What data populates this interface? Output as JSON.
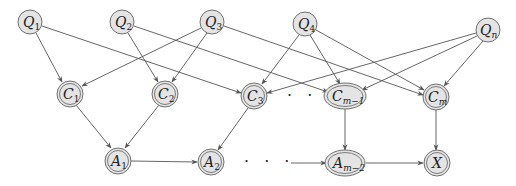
{
  "diagram": {
    "type": "bayesian-network",
    "colors": {
      "node_fill": "#e4e4e4",
      "node_stroke": "#707070",
      "edge": "#555555"
    },
    "query_nodes": [
      {
        "id": "Q1",
        "base": "Q",
        "sub": "1",
        "x": 30,
        "y": 22
      },
      {
        "id": "Q2",
        "base": "Q",
        "sub": "2",
        "x": 122,
        "y": 22
      },
      {
        "id": "Q3",
        "base": "Q",
        "sub": "3",
        "x": 212,
        "y": 22
      },
      {
        "id": "Q4",
        "base": "Q",
        "sub": "4",
        "x": 305,
        "y": 24
      },
      {
        "id": "Qn",
        "base": "Q",
        "sub": "n",
        "x": 488,
        "y": 30
      }
    ],
    "clause_nodes": [
      {
        "id": "C1",
        "base": "C",
        "sub": "1",
        "x": 70,
        "y": 94
      },
      {
        "id": "C2",
        "base": "C",
        "sub": "2",
        "x": 165,
        "y": 94
      },
      {
        "id": "C3",
        "base": "C",
        "sub": "3",
        "x": 254,
        "y": 96
      },
      {
        "id": "Cm-1",
        "base": "C",
        "sub": "m−1",
        "x": 345,
        "y": 96
      },
      {
        "id": "Cm",
        "base": "C",
        "sub": "m",
        "x": 436,
        "y": 97
      }
    ],
    "and_nodes": [
      {
        "id": "A1",
        "base": "A",
        "sub": "1",
        "x": 118,
        "y": 160
      },
      {
        "id": "A2",
        "base": "A",
        "sub": "2",
        "x": 211,
        "y": 162
      },
      {
        "id": "Am-2",
        "base": "A",
        "sub": "m−2",
        "x": 345,
        "y": 163
      },
      {
        "id": "X",
        "base": "X",
        "sub": "",
        "x": 437,
        "y": 163
      }
    ],
    "ellipsis": {
      "clause_row": "· · ·",
      "and_row": "· · ·"
    },
    "edges": [
      [
        "Q1",
        "C1"
      ],
      [
        "Q1",
        "C3"
      ],
      [
        "Q2",
        "C2"
      ],
      [
        "Q2",
        "Cm-1"
      ],
      [
        "Q3",
        "C1"
      ],
      [
        "Q3",
        "C2"
      ],
      [
        "Q3",
        "Cm"
      ],
      [
        "Q4",
        "C3"
      ],
      [
        "Q4",
        "Cm-1"
      ],
      [
        "Q4",
        "Cm"
      ],
      [
        "Qn",
        "C3"
      ],
      [
        "Qn",
        "Cm-1"
      ],
      [
        "Qn",
        "Cm"
      ],
      [
        "C1",
        "A1"
      ],
      [
        "C2",
        "A1"
      ],
      [
        "C3",
        "A2"
      ],
      [
        "Cm-1",
        "Am-2"
      ],
      [
        "Cm",
        "X"
      ],
      [
        "A1",
        "A2"
      ],
      [
        "dots",
        "Am-2"
      ],
      [
        "Am-2",
        "X"
      ]
    ]
  }
}
